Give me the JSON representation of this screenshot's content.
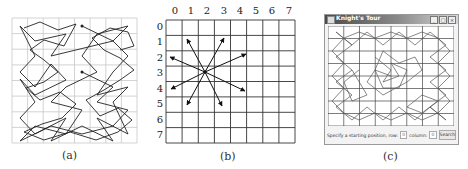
{
  "panels": {
    "a": {
      "caption": "(a)",
      "description": "Knight's tour path on an 8x8 board"
    },
    "b": {
      "caption": "(b)",
      "column_labels": [
        "0",
        "1",
        "2",
        "3",
        "4",
        "5",
        "6",
        "7"
      ],
      "row_labels": [
        "0",
        "1",
        "2",
        "3",
        "4",
        "5",
        "6",
        "7"
      ],
      "knight_position": {
        "row": 3,
        "column": 2
      },
      "description": "Eight possible knight moves from a square"
    },
    "c": {
      "caption": "(c)",
      "window": {
        "title": "Knight's Tour",
        "buttons": [
          "minimize",
          "maximize",
          "close"
        ]
      },
      "controls": {
        "prompt_label": "Specify a starting position, row:",
        "row_value": "0",
        "column_label": "column:",
        "column_value": "0",
        "search_button": "Search"
      }
    }
  },
  "colors": {
    "grid_light": "#c8c8c8",
    "grid_dark": "#333333",
    "path": "#222222",
    "titlebar": "#4a4a4a"
  }
}
